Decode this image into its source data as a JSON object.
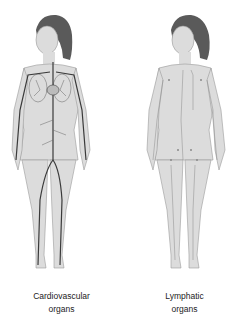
{
  "figures": [
    {
      "id": "cardiovascular",
      "caption_line1": "Cardiovascular",
      "caption_line2": "organs",
      "vessel_color": "#3a3a3a"
    },
    {
      "id": "lymphatic",
      "caption_line1": "Lymphatic",
      "caption_line2": "organs",
      "vessel_color": "#8a8a8a"
    }
  ],
  "colors": {
    "skin": "#dcdcdc",
    "skin_outline": "#9a9a9a",
    "hair": "#5a5a5a",
    "background": "#ffffff"
  }
}
